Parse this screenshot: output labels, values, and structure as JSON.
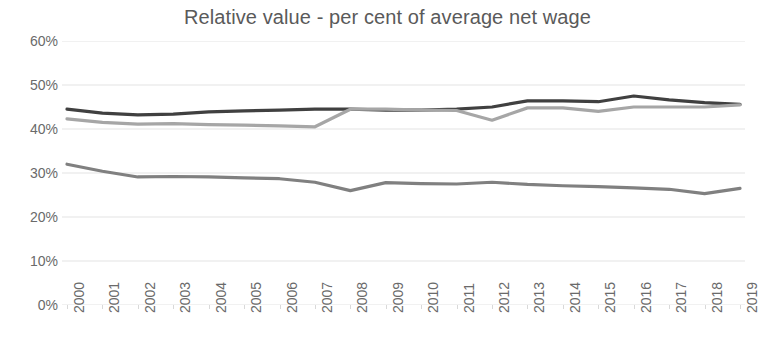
{
  "chart_data": {
    "type": "line",
    "title": "Relative value - per cent of average net wage",
    "xlabel": "",
    "ylabel": "",
    "ylim": [
      0,
      60
    ],
    "y_unit": "%",
    "y_ticks": [
      0,
      10,
      20,
      30,
      40,
      50,
      60
    ],
    "y_tick_labels": [
      "0%",
      "10%",
      "20%",
      "30%",
      "40%",
      "50%",
      "60%"
    ],
    "grid": true,
    "grid_axis": "y",
    "legend": false,
    "legend_position": "none",
    "x": [
      2000,
      2001,
      2002,
      2003,
      2004,
      2005,
      2006,
      2007,
      2008,
      2009,
      2010,
      2011,
      2012,
      2013,
      2014,
      2015,
      2016,
      2017,
      2018,
      2019
    ],
    "categories": [
      "2000",
      "2001",
      "2002",
      "2003",
      "2004",
      "2005",
      "2006",
      "2007",
      "2008",
      "2009",
      "2010",
      "2011",
      "2012",
      "2013",
      "2014",
      "2015",
      "2016",
      "2017",
      "2018",
      "2019"
    ],
    "series": [
      {
        "name": "series-1-dark",
        "color": "#404040",
        "values": [
          44.5,
          43.6,
          43.2,
          43.4,
          43.9,
          44.1,
          44.3,
          44.5,
          44.5,
          44.3,
          44.3,
          44.5,
          45.0,
          46.4,
          46.4,
          46.2,
          47.5,
          46.6,
          46.0,
          45.6
        ]
      },
      {
        "name": "series-2-light",
        "color": "#a6a6a6",
        "values": [
          42.3,
          41.5,
          41.1,
          41.2,
          41.0,
          40.9,
          40.7,
          40.5,
          44.5,
          44.5,
          44.3,
          44.2,
          42.0,
          44.8,
          44.8,
          44.0,
          45.0,
          45.0,
          45.0,
          45.5
        ]
      },
      {
        "name": "series-3-medium",
        "color": "#808080",
        "values": [
          32.0,
          30.4,
          29.1,
          29.2,
          29.1,
          28.9,
          28.7,
          27.9,
          26.0,
          27.8,
          27.6,
          27.5,
          27.9,
          27.4,
          27.1,
          26.9,
          26.6,
          26.3,
          25.3,
          26.5
        ]
      }
    ]
  },
  "axis": {
    "y_labels": [
      "60%",
      "50%",
      "40%",
      "30%",
      "20%",
      "10%",
      "0%"
    ],
    "x_labels": [
      "2000",
      "2001",
      "2002",
      "2003",
      "2004",
      "2005",
      "2006",
      "2007",
      "2008",
      "2009",
      "2010",
      "2011",
      "2012",
      "2013",
      "2014",
      "2015",
      "2016",
      "2017",
      "2018",
      "2019"
    ]
  },
  "colors": {
    "title": "#5a5a5a",
    "tick_text": "#6a6a6a",
    "gridline": "#e3e3e3",
    "background": "#ffffff",
    "series_1": "#404040",
    "series_2": "#a6a6a6",
    "series_3": "#808080"
  }
}
